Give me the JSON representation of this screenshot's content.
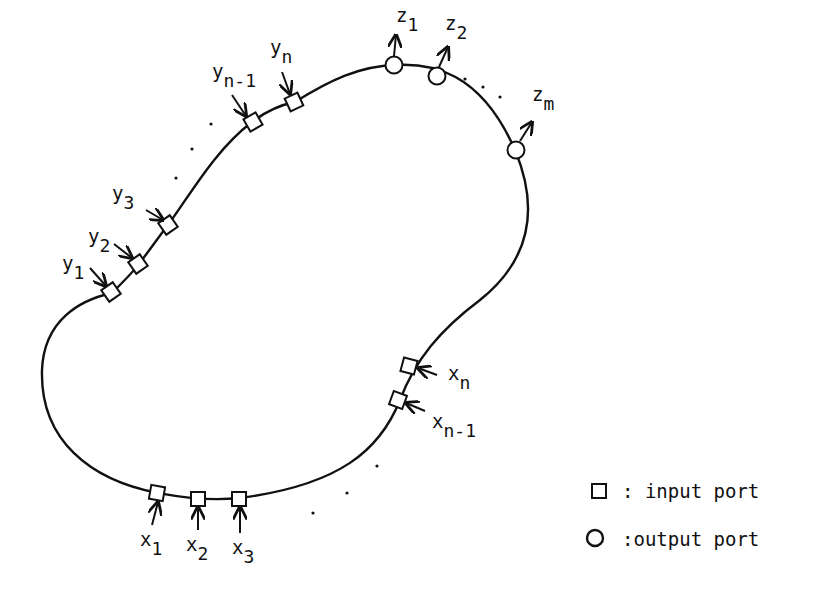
{
  "diagram": {
    "stroke_color": "#111111",
    "input_ports_y": [
      {
        "base": "y",
        "sub": "1"
      },
      {
        "base": "y",
        "sub": "2"
      },
      {
        "base": "y",
        "sub": "3"
      },
      {
        "base": "y",
        "sub": "n-1"
      },
      {
        "base": "y",
        "sub": "n"
      }
    ],
    "input_ports_x": [
      {
        "base": "x",
        "sub": "1"
      },
      {
        "base": "x",
        "sub": "2"
      },
      {
        "base": "x",
        "sub": "3"
      },
      {
        "base": "x",
        "sub": "n-1"
      },
      {
        "base": "x",
        "sub": "n"
      }
    ],
    "output_ports_z": [
      {
        "base": "z",
        "sub": "1"
      },
      {
        "base": "z",
        "sub": "2"
      },
      {
        "base": "z",
        "sub": "m"
      }
    ]
  },
  "legend": {
    "input": {
      "symbol": "square",
      "label": ": input port"
    },
    "output": {
      "symbol": "circle",
      "label": ":output port"
    }
  }
}
